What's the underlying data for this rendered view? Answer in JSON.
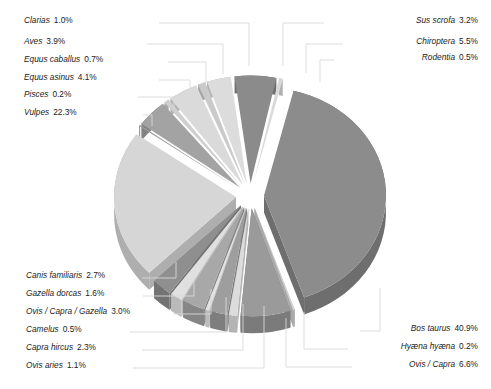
{
  "chart_data": {
    "type": "pie",
    "title": "",
    "subtitle": "",
    "xlabel": "",
    "ylabel": "",
    "style": "3d-exploded-pie",
    "legend_position": "callout-labels",
    "grid": false,
    "units": "percent",
    "total_percent": 100.0,
    "categories": [
      "Bos taurus",
      "Vulpes",
      "Ovis / Capra",
      "Chiroptera",
      "Equus asinus",
      "Aves",
      "Sus scrofa",
      "Ovis / Capra / Gazella",
      "Canis familiaris",
      "Capra hircus",
      "Gazella dorcas",
      "Ovis aries",
      "Clarias",
      "Equus caballus",
      "Camelus",
      "Rodentia",
      "Pisces",
      "Hyæna hyæna"
    ],
    "values": [
      40.9,
      22.3,
      6.6,
      5.5,
      4.1,
      3.9,
      3.2,
      3.0,
      2.7,
      2.3,
      1.6,
      1.1,
      1.0,
      0.7,
      0.5,
      0.5,
      0.2,
      0.2
    ],
    "slices": [
      {
        "name": "Bos taurus",
        "value": 40.9,
        "label": "Bos taurus  40.9%",
        "top": "#8c8c8c",
        "side": "#6e6e6e"
      },
      {
        "name": "Hyæna hyæna",
        "value": 0.2,
        "label": "Hyæna hyæna  0.2%",
        "top": "#d2d2d2",
        "side": "#aaaaaa"
      },
      {
        "name": "Ovis / Capra",
        "value": 6.6,
        "label": "Ovis / Capra  6.6%",
        "top": "#9a9a9a",
        "side": "#7b7b7b"
      },
      {
        "name": "Ovis aries",
        "value": 1.1,
        "label": "Ovis aries  1.1%",
        "top": "#dcdcdc",
        "side": "#b4b4b4"
      },
      {
        "name": "Capra hircus",
        "value": 2.3,
        "label": "Capra hircus  2.3%",
        "top": "#9e9e9e",
        "side": "#7e7e7e"
      },
      {
        "name": "Camelus",
        "value": 0.5,
        "label": "Camelus  0.5%",
        "top": "#e2e2e2",
        "side": "#bcbcbc"
      },
      {
        "name": "Ovis / Capra / Gazella",
        "value": 3.0,
        "label": "Ovis / Capra / Gazella  3.0%",
        "top": "#a8a8a8",
        "side": "#868686"
      },
      {
        "name": "Gazella dorcas",
        "value": 1.6,
        "label": "Gazella dorcas  1.6%",
        "top": "#e0e0e0",
        "side": "#bababa"
      },
      {
        "name": "Canis familiaris",
        "value": 2.7,
        "label": "Canis familiaris  2.7%",
        "top": "#8f8f8f",
        "side": "#737373"
      },
      {
        "name": "Vulpes",
        "value": 22.3,
        "label": "Vulpes  22.3%",
        "top": "#d6d6d6",
        "side": "#aeaeae"
      },
      {
        "name": "Pisces",
        "value": 0.2,
        "label": "Pisces  0.2%",
        "top": "#9b9b9b",
        "side": "#7c7c7c"
      },
      {
        "name": "Equus asinus",
        "value": 4.1,
        "label": "Equus asinus  4.1%",
        "top": "#a3a3a3",
        "side": "#838383"
      },
      {
        "name": "Equus caballus",
        "value": 0.7,
        "label": "Equus caballus  0.7%",
        "top": "#cfcfcf",
        "side": "#a8a8a8"
      },
      {
        "name": "Aves",
        "value": 3.9,
        "label": "Aves  3.9%",
        "top": "#dadada",
        "side": "#b2b2b2"
      },
      {
        "name": "Clarias",
        "value": 1.0,
        "label": "Clarias  1.0%",
        "top": "#cacaca",
        "side": "#a4a4a4"
      },
      {
        "name": "Sus scrofa",
        "value": 3.2,
        "label": "Sus scrofa  3.2%",
        "top": "#dcdcdc",
        "side": "#b5b5b5"
      },
      {
        "name": "Chiroptera",
        "value": 5.5,
        "label": "Chiroptera  5.5%",
        "top": "#8b8b8b",
        "side": "#6f6f6f"
      },
      {
        "name": "Rodentia",
        "value": 0.5,
        "label": "Rodentia  0.5%",
        "top": "#d9d9d9",
        "side": "#b0b0b0"
      }
    ]
  },
  "labels": {
    "left_top": [
      {
        "species": "Clarias",
        "percent": "1.0%",
        "x": 24,
        "y": 23,
        "anchor": "start",
        "line_x": 159,
        "line_y": 23,
        "tip_x": 249,
        "tip_y": 66
      },
      {
        "species": "Aves",
        "percent": "3.9%",
        "x": 24,
        "y": 44,
        "anchor": "start",
        "line_x": 147,
        "line_y": 44,
        "tip_x": 223,
        "tip_y": 74
      },
      {
        "species": "Equus caballus",
        "percent": "0.7%",
        "x": 24,
        "y": 62,
        "anchor": "start",
        "line_x": 168,
        "line_y": 62,
        "tip_x": 206,
        "tip_y": 83
      },
      {
        "species": "Equus asinus",
        "percent": "4.1%",
        "x": 24,
        "y": 80,
        "anchor": "start",
        "line_x": 159,
        "line_y": 80,
        "tip_x": 190,
        "tip_y": 95
      },
      {
        "species": "Pisces",
        "percent": "0.2%",
        "x": 24,
        "y": 97,
        "anchor": "start",
        "line_x": 138,
        "line_y": 97,
        "tip_x": 174,
        "tip_y": 110
      },
      {
        "species": "Vulpes",
        "percent": "22.3%",
        "x": 24,
        "y": 115,
        "anchor": "start",
        "line_x": 143,
        "line_y": 115,
        "tip_x": 152,
        "tip_y": 126
      }
    ],
    "left_bottom": [
      {
        "species": "Canis familiaris",
        "percent": "2.7%",
        "x": 26,
        "y": 278,
        "anchor": "start",
        "line_x": 142,
        "line_y": 278,
        "tip_x": 176,
        "tip_y": 262
      },
      {
        "species": "Gazella dorcas",
        "percent": "1.6%",
        "x": 26,
        "y": 296,
        "anchor": "start",
        "line_x": 143,
        "line_y": 296,
        "tip_x": 194,
        "tip_y": 276
      },
      {
        "species": "Ovis / Capra / Gazella",
        "percent": "3.0%",
        "x": 26,
        "y": 314,
        "anchor": "start",
        "line_x": 173,
        "line_y": 314,
        "tip_x": 211,
        "tip_y": 289
      },
      {
        "species": "Camelus",
        "percent": "0.5%",
        "x": 26,
        "y": 332,
        "anchor": "start",
        "line_x": 130,
        "line_y": 332,
        "tip_x": 226,
        "tip_y": 297
      },
      {
        "species": "Capra hircus",
        "percent": "2.3%",
        "x": 26,
        "y": 350,
        "anchor": "start",
        "line_x": 142,
        "line_y": 350,
        "tip_x": 243,
        "tip_y": 304
      },
      {
        "species": "Ovis aries",
        "percent": "1.1%",
        "x": 26,
        "y": 368,
        "anchor": "start",
        "line_x": 133,
        "line_y": 368,
        "tip_x": 264,
        "tip_y": 306
      }
    ],
    "right_top": [
      {
        "species": "Sus scrofa",
        "percent": "3.2%",
        "x": 478,
        "y": 23,
        "anchor": "end",
        "line_x": 324,
        "line_y": 23,
        "tip_x": 283,
        "tip_y": 66
      },
      {
        "species": "Chiroptera",
        "percent": "5.5%",
        "x": 478,
        "y": 44,
        "anchor": "end",
        "line_x": 343,
        "line_y": 44,
        "tip_x": 306,
        "tip_y": 73
      },
      {
        "species": "Rodentia",
        "percent": "0.5%",
        "x": 478,
        "y": 60,
        "anchor": "end",
        "line_x": 334,
        "line_y": 60,
        "tip_x": 320,
        "tip_y": 82
      }
    ],
    "right_bottom": [
      {
        "species": "Bos taurus",
        "percent": "40.9%",
        "x": 478,
        "y": 331,
        "anchor": "end",
        "line_x": 360,
        "line_y": 331,
        "tip_x": 380,
        "tip_y": 288
      },
      {
        "species": "Hyæna hyæna",
        "percent": "0.2%",
        "x": 478,
        "y": 349,
        "anchor": "end",
        "line_x": 348,
        "line_y": 349,
        "tip_x": 304,
        "tip_y": 312
      },
      {
        "species": "Ovis / Capra",
        "percent": "6.6%",
        "x": 478,
        "y": 367,
        "anchor": "end",
        "line_x": 352,
        "line_y": 367,
        "tip_x": 286,
        "tip_y": 318
      }
    ]
  },
  "geometry": {
    "cx": 250,
    "cy": 196,
    "rx": 122,
    "ry": 108,
    "depth": 17,
    "explode": 14,
    "start_angle": -76
  }
}
